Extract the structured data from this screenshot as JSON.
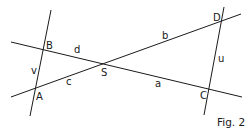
{
  "figure": {
    "caption": "Fig. 2",
    "line_color": "#1a1a1a",
    "background": "#ffffff"
  },
  "points": {
    "A": {
      "label": "A",
      "x": 35,
      "y": 90
    },
    "B": {
      "label": "B",
      "x": 43,
      "y": 50
    },
    "C": {
      "label": "C",
      "x": 209,
      "y": 89
    },
    "D": {
      "label": "D",
      "x": 221,
      "y": 21
    },
    "S": {
      "label": "S",
      "x": 103,
      "y": 64
    }
  },
  "segments": {
    "a": {
      "label": "a"
    },
    "b": {
      "label": "b"
    },
    "c": {
      "label": "c"
    },
    "d": {
      "label": "d"
    },
    "u": {
      "label": "u"
    },
    "v": {
      "label": "v"
    }
  },
  "lines": [
    {
      "name": "line-AB",
      "x1": 51,
      "y1": 10,
      "x2": 30,
      "y2": 116
    },
    {
      "name": "line-BC",
      "x1": 11,
      "y1": 42,
      "x2": 242,
      "y2": 97
    },
    {
      "name": "line-AD",
      "x1": 11,
      "y1": 97,
      "x2": 241,
      "y2": 14
    },
    {
      "name": "line-DC",
      "x1": 224,
      "y1": 7,
      "x2": 204,
      "y2": 115
    }
  ]
}
